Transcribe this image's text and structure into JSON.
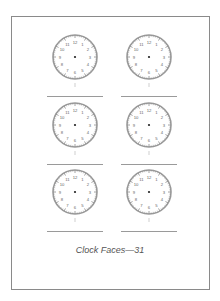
{
  "page": {
    "caption": "Clock Faces—31",
    "border_color": "#8a8a8a"
  },
  "clocks": [
    {
      "row": 1,
      "col": 1,
      "numbers": [
        "12",
        "1",
        "2",
        "3",
        "4",
        "5",
        "6",
        "7",
        "8",
        "9",
        "10",
        "11"
      ]
    },
    {
      "row": 1,
      "col": 2,
      "numbers": [
        "12",
        "1",
        "2",
        "3",
        "4",
        "5",
        "6",
        "7",
        "8",
        "9",
        "10",
        "11"
      ]
    },
    {
      "row": 2,
      "col": 1,
      "numbers": [
        "12",
        "1",
        "2",
        "3",
        "4",
        "5",
        "6",
        "7",
        "8",
        "9",
        "10",
        "11"
      ]
    },
    {
      "row": 2,
      "col": 2,
      "numbers": [
        "12",
        "1",
        "2",
        "3",
        "4",
        "5",
        "6",
        "7",
        "8",
        "9",
        "10",
        "11"
      ]
    },
    {
      "row": 3,
      "col": 1,
      "numbers": [
        "12",
        "1",
        "2",
        "3",
        "4",
        "5",
        "6",
        "7",
        "8",
        "9",
        "10",
        "11"
      ]
    },
    {
      "row": 3,
      "col": 2,
      "numbers": [
        "12",
        "1",
        "2",
        "3",
        "4",
        "5",
        "6",
        "7",
        "8",
        "9",
        "10",
        "11"
      ]
    }
  ]
}
